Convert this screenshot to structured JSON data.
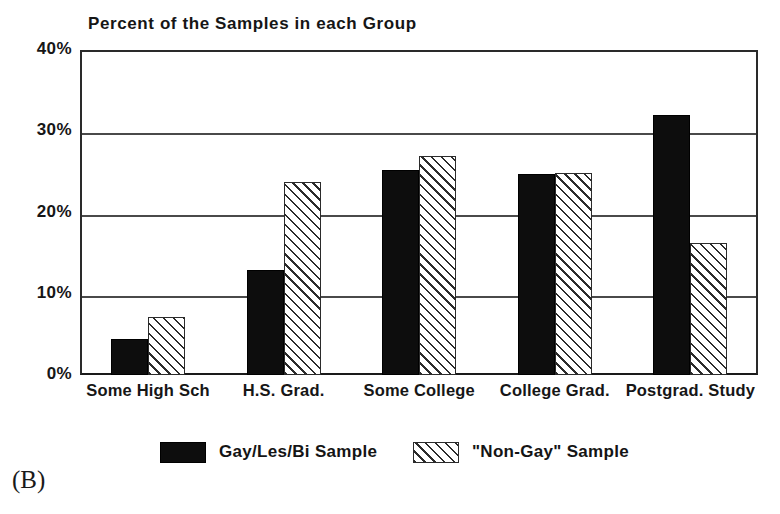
{
  "panel_label": "(B)",
  "chart_data": {
    "type": "bar",
    "title": "Percent of the Samples in each Group",
    "xlabel": "",
    "ylabel": "",
    "ylim": [
      0,
      40
    ],
    "yticks": [
      0,
      10,
      20,
      30,
      40
    ],
    "ytick_labels": [
      "0%",
      "10%",
      "20%",
      "30%",
      "40%"
    ],
    "grid": true,
    "grid_axis": "y",
    "legend_position": "bottom",
    "categories": [
      "Some High Sch",
      "H.S. Grad.",
      "Some College",
      "College Grad.",
      "Postgrad. Study"
    ],
    "series": [
      {
        "name": "Gay/Les/Bi Sample",
        "fill": "solid-black",
        "color": "#0d0d0d",
        "values": [
          4.4,
          12.9,
          25.2,
          24.8,
          32.0
        ]
      },
      {
        "name": "\"Non-Gay\" Sample",
        "fill": "diagonal-hatch",
        "color": "#2b2b2b",
        "values": [
          7.1,
          23.7,
          27.0,
          24.9,
          16.3
        ]
      }
    ]
  }
}
